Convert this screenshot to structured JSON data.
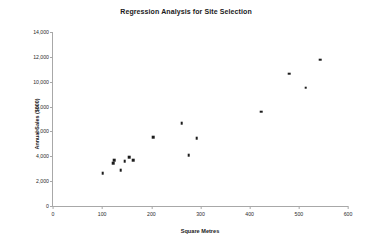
{
  "chart_data": {
    "type": "scatter",
    "title": "Regression Analysis for Site Selection",
    "xlabel": "Square Metres",
    "ylabel": "Annual Sales ($000)",
    "xlim": [
      0,
      600
    ],
    "ylim": [
      0,
      14000
    ],
    "grid": false,
    "legend": null,
    "xticks": [
      0,
      100,
      200,
      300,
      400,
      500,
      600
    ],
    "xtick_labels": [
      "0",
      "100",
      "200",
      "300",
      "400",
      "500",
      "600"
    ],
    "yticks": [
      0,
      2000,
      4000,
      6000,
      8000,
      10000,
      12000,
      14000
    ],
    "ytick_labels": [
      "0",
      "2,000",
      "4,000",
      "6,000",
      "8,000",
      "10,000",
      "12,000",
      "14,000"
    ],
    "marker_color": "#1c1c1c",
    "series": [
      {
        "name": "Sites",
        "points": [
          {
            "x": 101,
            "y": 2640
          },
          {
            "x": 122,
            "y": 3440
          },
          {
            "x": 124,
            "y": 3680
          },
          {
            "x": 138,
            "y": 2880
          },
          {
            "x": 146,
            "y": 3600
          },
          {
            "x": 155,
            "y": 3920
          },
          {
            "x": 163,
            "y": 3680
          },
          {
            "x": 204,
            "y": 5520
          },
          {
            "x": 262,
            "y": 6640
          },
          {
            "x": 276,
            "y": 4080
          },
          {
            "x": 292,
            "y": 5440
          },
          {
            "x": 424,
            "y": 7600
          },
          {
            "x": 480,
            "y": 10640
          },
          {
            "x": 514,
            "y": 9520
          },
          {
            "x": 544,
            "y": 11760
          }
        ]
      }
    ]
  }
}
